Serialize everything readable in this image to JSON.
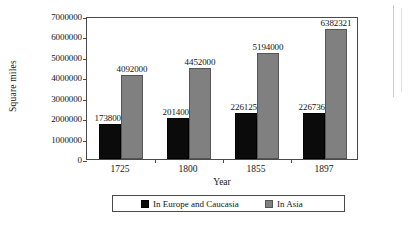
{
  "chart_data": {
    "type": "bar",
    "title": "",
    "xlabel": "Year",
    "ylabel": "Square miles",
    "categories": [
      "1725",
      "1800",
      "1855",
      "1897"
    ],
    "series": [
      {
        "name": "In Europe and Caucasia",
        "color": "#0b0b0b",
        "values": [
          1738000,
          2014000,
          2261250,
          2267360
        ],
        "labels": [
          "1738000",
          "2014000",
          "2261250",
          "2267360"
        ]
      },
      {
        "name": "In Asia",
        "color": "#808080",
        "values": [
          4092000,
          4452000,
          5194000,
          6382321
        ],
        "labels": [
          "4092000",
          "4452000",
          "5194000",
          "6382321"
        ]
      }
    ],
    "ylim": [
      0,
      7000000
    ],
    "ytick_values": [
      0,
      1000000,
      2000000,
      3000000,
      4000000,
      5000000,
      6000000,
      7000000
    ],
    "ytick_labels": [
      "0",
      "1000000",
      "2000000",
      "3000000",
      "4000000",
      "5000000",
      "6000000",
      "7000000"
    ],
    "grid": false,
    "legend_position": "bottom"
  }
}
